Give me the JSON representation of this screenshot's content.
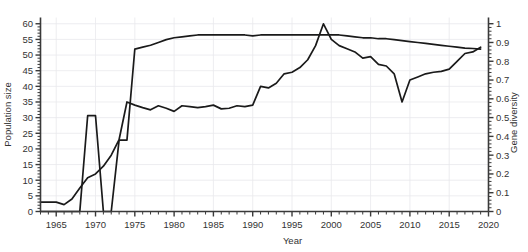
{
  "chart_data": {
    "type": "line",
    "title": "",
    "xlabel": "Year",
    "ylabel": "Population size",
    "y2label": "Gene diversity",
    "xlim": [
      1963,
      2020
    ],
    "ylim": [
      0,
      62
    ],
    "y2lim": [
      0,
      1.033
    ],
    "grid": true,
    "legend": "none",
    "xticks": [
      1965,
      1970,
      1975,
      1980,
      1985,
      1990,
      1995,
      2000,
      2005,
      2010,
      2015,
      2020
    ],
    "xticklabels": [
      "1965",
      "1970",
      "1975",
      "1980",
      "1985",
      "1990",
      "1995",
      "2000",
      "2005",
      "2010",
      "2015",
      "2020"
    ],
    "yticks": [
      0,
      5,
      10,
      15,
      20,
      25,
      30,
      35,
      40,
      45,
      50,
      55,
      60
    ],
    "yticklabels": [
      "0",
      "5",
      "10",
      "15",
      "20",
      "25",
      "30",
      "35",
      "40",
      "45",
      "50",
      "55",
      "60"
    ],
    "y2ticks": [
      0,
      0.1,
      0.2,
      0.3,
      0.4,
      0.5,
      0.6,
      0.7,
      0.8,
      0.9,
      1
    ],
    "y2ticklabels": [
      "0",
      "0.1",
      "0.2",
      "0.3",
      "0.4",
      "0.5",
      "0.6",
      "0.7",
      "0.8",
      "0.9",
      "1"
    ],
    "line_color": "#1a1a1a",
    "grid_color": "#e8e8ec",
    "axis_color": "#3a3a3a",
    "series": [
      {
        "name": "Population size",
        "axis": "left",
        "x": [
          1963,
          1964,
          1965,
          1966,
          1967,
          1968,
          1969,
          1970,
          1971,
          1972,
          1973,
          1974,
          1975,
          1976,
          1977,
          1978,
          1979,
          1980,
          1981,
          1982,
          1983,
          1984,
          1985,
          1986,
          1987,
          1988,
          1989,
          1990,
          1991,
          1992,
          1993,
          1994,
          1995,
          1996,
          1997,
          1998,
          1999,
          2000,
          2001,
          2002,
          2003,
          2004,
          2005,
          2006,
          2007,
          2008,
          2009,
          2010,
          2011,
          2012,
          2013,
          2014,
          2015,
          2016,
          2017,
          2018,
          2019
        ],
        "y": [
          3.0,
          3.0,
          3.0,
          2.2,
          4.0,
          7.5,
          10.8,
          12.0,
          14.5,
          18.0,
          23.0,
          35.0,
          34.0,
          33.2,
          32.5,
          33.8,
          33.0,
          32.0,
          33.8,
          33.5,
          33.2,
          33.5,
          34.0,
          32.8,
          33.0,
          33.8,
          33.5,
          34.0,
          40.0,
          39.5,
          41.0,
          44.0,
          44.5,
          46.0,
          48.5,
          53.0,
          60.0,
          55.0,
          53.0,
          52.0,
          51.0,
          49.0,
          49.5,
          47.0,
          46.5,
          44.0,
          35.0,
          42.0,
          43.0,
          44.0,
          44.5,
          44.8,
          45.5,
          48.0,
          50.5,
          51.0,
          52.5
        ]
      },
      {
        "name": "Gene diversity",
        "axis": "right",
        "x": [
          1963,
          1964,
          1965,
          1966,
          1967,
          1968,
          1969,
          1970,
          1971,
          1972,
          1973,
          1974,
          1975,
          1976,
          1977,
          1978,
          1979,
          1980,
          1981,
          1982,
          1983,
          1984,
          1985,
          1986,
          1987,
          1988,
          1989,
          1990,
          1991,
          1992,
          1993,
          1994,
          1995,
          1996,
          1997,
          1998,
          1999,
          2000,
          2001,
          2002,
          2003,
          2004,
          2005,
          2006,
          2007,
          2008,
          2009,
          2010,
          2011,
          2012,
          2013,
          2014,
          2015,
          2016,
          2017,
          2018,
          2019
        ],
        "y": [
          0.0,
          0.0,
          0.0,
          0.0,
          0.0,
          0.0,
          0.51,
          0.51,
          0.0,
          0.0,
          0.38,
          0.38,
          0.865,
          0.875,
          0.885,
          0.9,
          0.915,
          0.925,
          0.93,
          0.935,
          0.94,
          0.94,
          0.94,
          0.94,
          0.94,
          0.94,
          0.94,
          0.935,
          0.94,
          0.94,
          0.94,
          0.94,
          0.94,
          0.94,
          0.94,
          0.94,
          0.94,
          0.94,
          0.94,
          0.935,
          0.93,
          0.925,
          0.925,
          0.92,
          0.92,
          0.915,
          0.91,
          0.905,
          0.9,
          0.895,
          0.89,
          0.885,
          0.88,
          0.875,
          0.87,
          0.868,
          0.865
        ]
      }
    ]
  }
}
